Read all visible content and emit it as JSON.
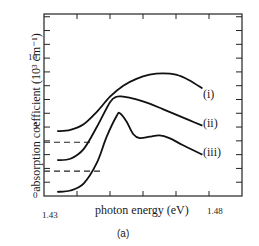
{
  "chart_data": {
    "type": "line",
    "title": "",
    "panel_label": "(a)",
    "xlabel": "photon energy (eV)",
    "ylabel": "absorption coefficient (10³ cm⁻¹)",
    "xlim": [
      1.43,
      1.49
    ],
    "ylim": [
      0,
      13.2
    ],
    "x_tick_labels": [
      "1.43",
      "1.48"
    ],
    "y_tick_labels": [
      "0",
      "5",
      "10"
    ],
    "grid": false,
    "legend": "inline curve labels at right end",
    "series": [
      {
        "name": "(i)",
        "x": [
          1.434,
          1.438,
          1.442,
          1.446,
          1.45,
          1.454,
          1.458,
          1.462,
          1.466,
          1.47,
          1.474,
          1.478
        ],
        "values": [
          4.7,
          4.8,
          5.2,
          6.1,
          7.2,
          8.0,
          8.5,
          8.8,
          8.9,
          8.8,
          8.4,
          7.8
        ]
      },
      {
        "name": "(ii)",
        "x": [
          1.434,
          1.438,
          1.442,
          1.446,
          1.45,
          1.452,
          1.454,
          1.458,
          1.462,
          1.466,
          1.47,
          1.474,
          1.478
        ],
        "values": [
          2.6,
          2.7,
          3.4,
          5.0,
          6.8,
          7.2,
          7.2,
          7.0,
          6.7,
          6.3,
          5.9,
          5.5,
          5.1
        ]
      },
      {
        "name": "(iii)",
        "x": [
          1.434,
          1.438,
          1.442,
          1.446,
          1.449,
          1.452,
          1.453,
          1.455,
          1.457,
          1.459,
          1.462,
          1.465,
          1.468,
          1.472,
          1.478
        ],
        "values": [
          0.3,
          0.4,
          0.9,
          2.4,
          4.3,
          5.8,
          6.0,
          5.4,
          4.5,
          4.2,
          4.3,
          4.4,
          4.2,
          3.7,
          3.0
        ]
      }
    ],
    "reference_lines": [
      {
        "style": "dashed",
        "y": 3.9,
        "x_range": [
          1.43,
          1.445
        ]
      },
      {
        "style": "dashed",
        "y": 1.8,
        "x_range": [
          1.43,
          1.448
        ]
      }
    ]
  }
}
